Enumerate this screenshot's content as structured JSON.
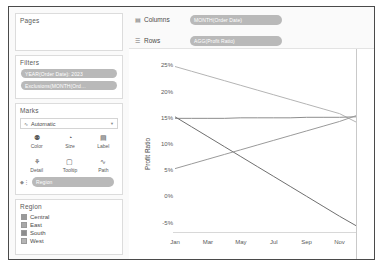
{
  "left_panel": {
    "pages": {
      "title": "Pages"
    },
    "filters": {
      "title": "Filters",
      "pills": [
        "YEAR(Order Date): 2023",
        "Exclusions(MONTH(Ord…"
      ]
    },
    "marks": {
      "title": "Marks",
      "mark_type": "Automatic",
      "mark_type_icon": "line-mark-icon",
      "buttons": [
        {
          "label": "Color",
          "icon": "color-icon",
          "glyph": "⚉"
        },
        {
          "label": "Size",
          "icon": "size-icon",
          "glyph": "◔"
        },
        {
          "label": "Label",
          "icon": "label-icon",
          "glyph": "▤"
        },
        {
          "label": "Detail",
          "icon": "detail-icon",
          "glyph": "⚘"
        },
        {
          "label": "Tooltip",
          "icon": "tooltip-icon",
          "glyph": "▢"
        },
        {
          "label": "Path",
          "icon": "path-icon",
          "glyph": "∿"
        }
      ],
      "encoding_pill": "Region",
      "encoding_icon": "color-encoding-icon"
    },
    "legend": {
      "title": "Region",
      "items": [
        {
          "label": "Central",
          "color": "#9a9a9a"
        },
        {
          "label": "East",
          "color": "#a8a8a8"
        },
        {
          "label": "South",
          "color": "#8d8d8d"
        },
        {
          "label": "West",
          "color": "#b4b4b4"
        }
      ]
    }
  },
  "shelves": [
    {
      "label": "Columns",
      "icon": "columns-icon",
      "pill": "MONTH(Order Date)"
    },
    {
      "label": "Rows",
      "icon": "rows-icon",
      "pill": "AGG(Profit Ratio)"
    }
  ],
  "chart_data": {
    "type": "line",
    "title": "",
    "xlabel": "",
    "ylabel": "Profit Ratio",
    "x": [
      "Jan",
      "Feb",
      "Mar",
      "Apr",
      "May",
      "Jun",
      "Jul",
      "Aug",
      "Sep",
      "Oct",
      "Nov",
      "Dec"
    ],
    "xtick_labels": [
      "Jan",
      "Mar",
      "May",
      "Jul",
      "Sep",
      "Nov"
    ],
    "ytick_labels": [
      "25%",
      "20%",
      "15%",
      "10%",
      "5%",
      "0%",
      "-5%"
    ],
    "ytick_values": [
      25,
      20,
      15,
      10,
      5,
      0,
      -5
    ],
    "ylim": [
      -7,
      27
    ],
    "grid": false,
    "legend_position": "left-panel",
    "series": [
      {
        "name": "Central",
        "color": "#b4b4b4",
        "values": [
          24.8,
          23.9,
          23.0,
          22.1,
          21.2,
          20.3,
          19.4,
          18.5,
          17.6,
          16.7,
          15.8,
          14.2
        ]
      },
      {
        "name": "East",
        "color": "#8d8d8d",
        "values": [
          14.9,
          14.9,
          14.9,
          14.9,
          15.0,
          15.0,
          15.0,
          15.0,
          15.1,
          15.1,
          15.1,
          15.2
        ]
      },
      {
        "name": "South",
        "color": "#6e6e6e",
        "values": [
          15.2,
          13.3,
          11.4,
          9.5,
          7.6,
          5.7,
          3.8,
          1.9,
          0.0,
          -1.9,
          -3.8,
          -5.6
        ]
      },
      {
        "name": "West",
        "color": "#9a9a9a",
        "values": [
          5.3,
          6.2,
          7.1,
          8.0,
          8.9,
          9.8,
          10.7,
          11.6,
          12.5,
          13.4,
          14.3,
          15.4
        ]
      }
    ]
  }
}
